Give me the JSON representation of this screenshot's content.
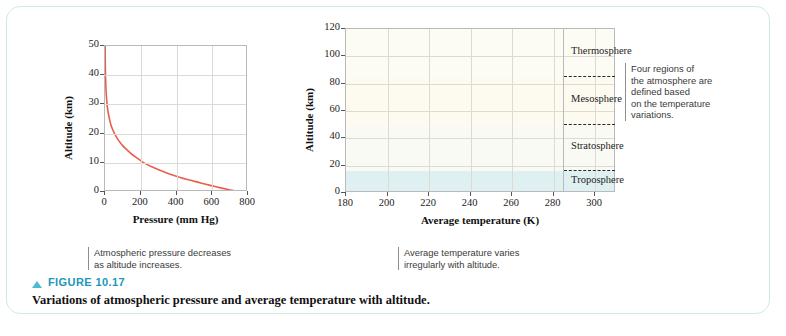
{
  "figure": {
    "marker_icon": "triangle-up-icon",
    "number_label": "FIGURE 10.17",
    "caption": "Variations of atmospheric pressure and average temperature with altitude.",
    "accent_color": "#2196b8",
    "marker_color": "#4bbcd0",
    "border_color": "#cfe8ec"
  },
  "callouts": {
    "pressure": "Atmospheric pressure decreases\nas altitude increases.",
    "temperature": "Average temperature varies\nirregularly with altitude.",
    "regions": "Four regions of\nthe atmosphere are\ndefined based\non the temperature\nvariations."
  },
  "chart_data": [
    {
      "id": "pressure-altitude",
      "type": "line",
      "title": "",
      "xlabel": "Pressure (mm Hg)",
      "ylabel": "Altitude (km)",
      "xlim": [
        0,
        800
      ],
      "ylim": [
        0,
        50
      ],
      "xticks": [
        0,
        200,
        400,
        600,
        800
      ],
      "yticks": [
        0,
        10,
        20,
        30,
        40,
        50
      ],
      "grid": true,
      "legend": "none",
      "line_color": "#e8604c",
      "x": [
        760,
        700,
        640,
        600,
        540,
        480,
        420,
        360,
        300,
        255,
        226,
        198,
        170,
        141,
        120,
        100,
        84,
        70,
        55,
        42,
        33,
        25,
        19,
        14,
        11,
        8,
        6,
        4.5,
        3,
        2,
        1.2,
        0.8
      ],
      "y": [
        0,
        0.7,
        1.5,
        2.1,
        3.0,
        4.0,
        5.0,
        6.2,
        7.6,
        8.8,
        9.7,
        10.8,
        12.0,
        13.4,
        14.6,
        15.8,
        17.0,
        18.2,
        19.8,
        21.5,
        23.0,
        25.0,
        26.8,
        28.8,
        30.5,
        32.8,
        34.8,
        36.8,
        39.5,
        42.5,
        46.0,
        50.0
      ]
    },
    {
      "id": "temperature-altitude",
      "type": "line",
      "title": "",
      "xlabel": "Average temperature (K)",
      "ylabel": "Altitude (km)",
      "xlim": [
        180,
        310
      ],
      "ylim": [
        0,
        120
      ],
      "xticks": [
        180,
        200,
        220,
        240,
        260,
        280,
        300
      ],
      "yticks": [
        0,
        20,
        40,
        60,
        80,
        100,
        120
      ],
      "grid": true,
      "legend": "none",
      "line_color": "#e8604c",
      "x": [
        288,
        280,
        268,
        256,
        244,
        232,
        224,
        219,
        217,
        216.5,
        217.5,
        220,
        224,
        230,
        238,
        247,
        257,
        265,
        271,
        273,
        272,
        268,
        261,
        252,
        243,
        234,
        226,
        218,
        210,
        203,
        196,
        190,
        185,
        182,
        181.5,
        183,
        187,
        192,
        198,
        205,
        210,
        213,
        214.5
      ],
      "y": [
        0.3,
        1.2,
        2.6,
        4.0,
        5.6,
        7.4,
        9.2,
        10.8,
        12.2,
        13.6,
        15.2,
        17.0,
        19.2,
        22.0,
        25.5,
        29.5,
        34.5,
        39.0,
        44.0,
        48.5,
        52.0,
        55.5,
        58.5,
        61.5,
        64.0,
        66.5,
        69.0,
        71.5,
        74.0,
        76.5,
        79.0,
        81.0,
        83.0,
        85.5,
        88.0,
        90.5,
        93.0,
        95.0,
        96.8,
        98.2,
        99.0,
        99.5,
        99.8
      ],
      "regions": [
        {
          "name": "Troposphere",
          "from": 0,
          "to": 16,
          "band_color": "#dff0f3"
        },
        {
          "name": "Stratosphere",
          "from": 16,
          "to": 50,
          "band_color": "#fafaf4"
        },
        {
          "name": "Mesosphere",
          "from": 50,
          "to": 85,
          "band_color": "#fdfaf0"
        },
        {
          "name": "Thermosphere",
          "from": 85,
          "to": 120,
          "band_color": "#fdfcf4"
        }
      ],
      "region_boundaries": [
        16,
        50,
        85
      ]
    }
  ]
}
